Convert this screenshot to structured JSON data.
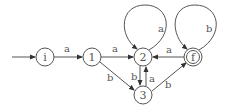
{
  "diagram": {
    "type": "finite-automaton",
    "colors": {
      "stroke": "#555555",
      "background": "#ffffff"
    },
    "states": [
      {
        "id": "i",
        "label": "i",
        "initial": true,
        "accepting": false
      },
      {
        "id": "1",
        "label": "1",
        "initial": false,
        "accepting": false
      },
      {
        "id": "2",
        "label": "2",
        "initial": false,
        "accepting": false
      },
      {
        "id": "3",
        "label": "3",
        "initial": false,
        "accepting": false
      },
      {
        "id": "f",
        "label": "f",
        "initial": false,
        "accepting": true
      }
    ],
    "transitions": [
      {
        "from": "i",
        "to": "1",
        "label": "a"
      },
      {
        "from": "1",
        "to": "2",
        "label": "a"
      },
      {
        "from": "1",
        "to": "3",
        "label": "b"
      },
      {
        "from": "2",
        "to": "2",
        "label": "a"
      },
      {
        "from": "2",
        "to": "3",
        "label": "b"
      },
      {
        "from": "3",
        "to": "2",
        "label": "a"
      },
      {
        "from": "3",
        "to": "f",
        "label": "b"
      },
      {
        "from": "f",
        "to": "2",
        "label": "a"
      },
      {
        "from": "f",
        "to": "f",
        "label": "b"
      }
    ]
  }
}
